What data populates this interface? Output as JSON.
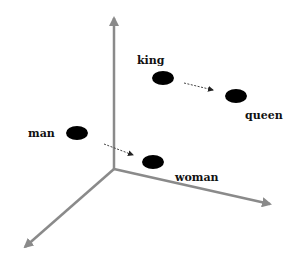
{
  "diagram": {
    "colors": {
      "axis": "#8a8a8a",
      "point": "#000000",
      "label": "#111111",
      "background": "#ffffff"
    },
    "axes": {
      "origin": [
        114,
        169
      ],
      "y_tip": [
        114,
        18
      ],
      "x_tip": [
        270,
        204
      ],
      "z_tip": [
        25,
        247
      ]
    },
    "points": [
      {
        "label": "king",
        "cx": 163,
        "cy": 78,
        "lx": 137,
        "ly": 64
      },
      {
        "label": "queen",
        "cx": 236,
        "cy": 96,
        "lx": 245,
        "ly": 119
      },
      {
        "label": "man",
        "cx": 77,
        "cy": 133,
        "lx": 28,
        "ly": 137
      },
      {
        "label": "woman",
        "cx": 153,
        "cy": 162,
        "lx": 175,
        "ly": 181
      }
    ],
    "arrows": [
      {
        "from": "king",
        "to": "queen",
        "x1": 184,
        "y1": 83,
        "x2": 213,
        "y2": 90
      },
      {
        "from": "man",
        "to": "woman",
        "x1": 104,
        "y1": 144,
        "x2": 133,
        "y2": 155
      }
    ]
  }
}
